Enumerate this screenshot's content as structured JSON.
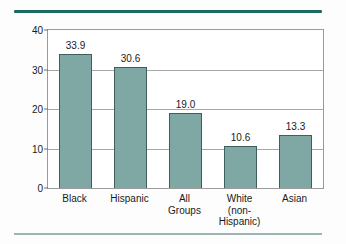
{
  "chart_data": {
    "type": "bar",
    "title": "",
    "xlabel": "",
    "ylabel": "Poverty rate",
    "ylim": [
      0,
      40
    ],
    "yticks": [
      0,
      10,
      20,
      30,
      40
    ],
    "ytick_labels": [
      "0",
      "10",
      "20",
      "30",
      "40"
    ],
    "grid": true,
    "gridlines_at": [
      10,
      20,
      30
    ],
    "legend": "none",
    "categories": [
      "Black",
      "Hispanic",
      "All Groups",
      "White (non-Hispanic)",
      "Asian"
    ],
    "category_lines": [
      [
        "Black"
      ],
      [
        "Hispanic"
      ],
      [
        "All",
        "Groups"
      ],
      [
        "White",
        "(non-",
        "Hispanic)"
      ],
      [
        "Asian"
      ]
    ],
    "values": [
      33.9,
      30.6,
      19.0,
      10.6,
      13.3
    ],
    "value_labels": [
      "33.9",
      "30.6",
      "19.0",
      "10.6",
      "13.3"
    ],
    "colors": {
      "bar_fill": "#7fa8a4",
      "bar_outline": "#3f5f5c",
      "rule_top": "#1d6b63",
      "rule_bottom": "#9db5b2",
      "axis": "#9a9a9a",
      "grid": "#a8a8a8",
      "text": "#1a1a1a",
      "background": "#fdfdfd"
    }
  }
}
